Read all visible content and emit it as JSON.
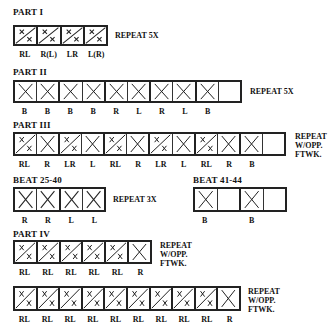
{
  "part1": {
    "title": "PART I",
    "repeat": [
      "REPEAT 5X"
    ],
    "cells": [
      {
        "mark": "split",
        "label": "RL"
      },
      {
        "mark": "split",
        "label": "R(L)"
      },
      {
        "mark": "split",
        "label": "LR"
      },
      {
        "mark": "split",
        "label": "L(R)"
      }
    ]
  },
  "part2": {
    "title": "PART II",
    "repeat": [
      "REPEAT 5X"
    ],
    "cells": [
      {
        "mark": "x",
        "label": "B"
      },
      {
        "mark": "x",
        "label": "B"
      },
      {
        "mark": "x",
        "label": "B"
      },
      {
        "mark": "x",
        "label": "B"
      },
      {
        "mark": "x",
        "label": "R"
      },
      {
        "mark": "x",
        "label": "L"
      },
      {
        "mark": "x",
        "label": "R"
      },
      {
        "mark": "x",
        "label": "L"
      },
      {
        "mark": "x",
        "label": "B"
      },
      {
        "mark": "empty",
        "label": ""
      }
    ]
  },
  "part3": {
    "title": "PART III",
    "repeat": [
      "REPEAT",
      "W/OPP.",
      "FTWK."
    ],
    "cells": [
      {
        "mark": "split",
        "label": "RL"
      },
      {
        "mark": "x",
        "label": "R"
      },
      {
        "mark": "split",
        "label": "LR"
      },
      {
        "mark": "x",
        "label": "L"
      },
      {
        "mark": "split",
        "label": "RL"
      },
      {
        "mark": "x",
        "label": "R"
      },
      {
        "mark": "split",
        "label": "LR"
      },
      {
        "mark": "x",
        "label": "L"
      },
      {
        "mark": "split",
        "label": "RL"
      },
      {
        "mark": "x",
        "label": "R"
      },
      {
        "mark": "x",
        "label": "B"
      },
      {
        "mark": "empty",
        "label": ""
      }
    ]
  },
  "beat25": {
    "title": "BEAT 25-40",
    "repeat": [
      "REPEAT 3X"
    ],
    "cells": [
      {
        "mark": "x",
        "label": "R"
      },
      {
        "mark": "x",
        "label": "R"
      },
      {
        "mark": "x",
        "label": "L"
      },
      {
        "mark": "x",
        "label": "L"
      }
    ]
  },
  "beat41": {
    "title": "BEAT 41-44",
    "cells": [
      {
        "mark": "x",
        "label": "B"
      },
      {
        "mark": "empty",
        "label": ""
      },
      {
        "mark": "x",
        "label": "B"
      },
      {
        "mark": "empty",
        "label": ""
      }
    ]
  },
  "part4": {
    "title": "PART IV",
    "row1": {
      "repeat": [
        "REPEAT",
        "W/OPP.",
        "FTWK."
      ],
      "cells": [
        {
          "mark": "split",
          "label": "RL"
        },
        {
          "mark": "split",
          "label": "RL"
        },
        {
          "mark": "split",
          "label": "RL"
        },
        {
          "mark": "split",
          "label": "RL"
        },
        {
          "mark": "split",
          "label": "RL"
        },
        {
          "mark": "x",
          "label": "R"
        }
      ]
    },
    "row2": {
      "repeat": [
        "REPEAT",
        "W/OPP.",
        "FTWK."
      ],
      "cells": [
        {
          "mark": "split",
          "label": "RL"
        },
        {
          "mark": "split",
          "label": "RL"
        },
        {
          "mark": "split",
          "label": "RL"
        },
        {
          "mark": "split",
          "label": "RL"
        },
        {
          "mark": "split",
          "label": "RL"
        },
        {
          "mark": "split",
          "label": "RL"
        },
        {
          "mark": "split",
          "label": "RL"
        },
        {
          "mark": "split",
          "label": "RL"
        },
        {
          "mark": "split",
          "label": "RL"
        },
        {
          "mark": "x",
          "label": "R"
        }
      ]
    }
  }
}
